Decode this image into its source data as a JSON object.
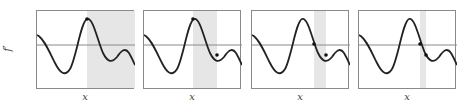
{
  "figure": {
    "ylabel": "f′",
    "xlabel": "x",
    "panels": [
      {
        "left": 36,
        "shade": [
          50,
          98
        ],
        "dots": [
          [
            50,
            8
          ]
        ]
      },
      {
        "left": 143,
        "shade": [
          49,
          73
        ],
        "dots": [
          [
            49,
            8
          ],
          [
            73,
            44
          ]
        ]
      },
      {
        "left": 251,
        "shade": [
          62,
          74
        ],
        "dots": [
          [
            62,
            33
          ],
          [
            74,
            44
          ]
        ]
      },
      {
        "left": 358,
        "shade": [
          61,
          67
        ],
        "dots": [
          [
            61,
            33
          ],
          [
            67,
            44
          ]
        ]
      }
    ],
    "colors": {
      "curve": "#222222",
      "axis": "#8a8a8a",
      "shade": "#e6e6e6",
      "dot": "#111111"
    }
  }
}
